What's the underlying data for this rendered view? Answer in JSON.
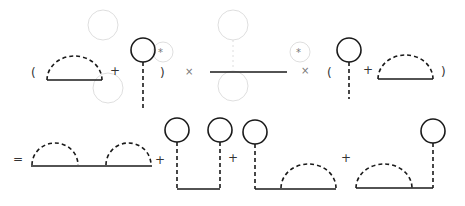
{
  "figure": {
    "colors": {
      "ink": "#1a1a1a",
      "ghost": "#d6d6d6",
      "background": "#ffffff"
    }
  },
  "top_row": {
    "open_paren_1": "(",
    "plus_1": "+",
    "close_paren_1": ")",
    "times_1": "×",
    "times_2": "×",
    "open_paren_2": "(",
    "plus_2": "+",
    "close_paren_2": ")",
    "terms": [
      {
        "id": "sunset-arc-1",
        "type": "half-circle-dashed-on-solid-line"
      },
      {
        "id": "tadpole-1",
        "type": "solid-loop-with-dashed-stem"
      },
      {
        "id": "bare-propagator",
        "type": "solid-line"
      },
      {
        "id": "tadpole-2",
        "type": "solid-loop-with-dashed-stem"
      },
      {
        "id": "sunset-arc-2",
        "type": "half-circle-dashed-on-solid-line"
      }
    ]
  },
  "bottom_row": {
    "equals": "=",
    "plus_1": "+",
    "plus_2": "+",
    "plus_3": "+",
    "terms": [
      {
        "id": "double-arc",
        "type": "two-dashed-arcs-on-solid-line"
      },
      {
        "id": "double-tadpole",
        "type": "two-loops-with-dashed-stems-joined-by-solid-line"
      },
      {
        "id": "tadpole-then-arc",
        "type": "loop-stem-left-arc-right"
      },
      {
        "id": "arc-then-tadpole",
        "type": "arc-left-loop-stem-right"
      }
    ]
  }
}
